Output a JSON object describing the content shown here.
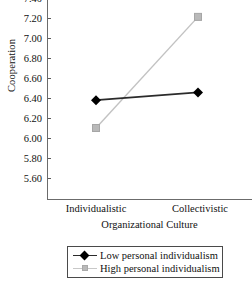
{
  "chart_data": {
    "type": "line",
    "title": "",
    "xlabel": "Organizational Culture",
    "ylabel": "Cooperation",
    "categories": [
      "Individualistic",
      "Collectivistic"
    ],
    "ylim": [
      5.6,
      7.4
    ],
    "ytick_labels": [
      "7.40",
      "7.20",
      "7.00",
      "6.80",
      "6.60",
      "6.40",
      "6.20",
      "6.00",
      "5.80",
      "5.60"
    ],
    "ytick_values": [
      7.4,
      7.2,
      7.0,
      6.8,
      6.6,
      6.4,
      6.2,
      6.0,
      5.8,
      5.6
    ],
    "grid": false,
    "legend_position": "bottom",
    "series": [
      {
        "name": "Low personal individualism",
        "values": [
          6.48,
          6.55
        ],
        "marker": "diamond",
        "color": "#2b2b2b"
      },
      {
        "name": "High personal individualism",
        "values": [
          6.23,
          7.23
        ],
        "marker": "square",
        "color": "#c2c2c2"
      }
    ]
  },
  "legend": {
    "items": [
      {
        "label": "Low personal individualism"
      },
      {
        "label": "High personal individualism"
      }
    ]
  }
}
